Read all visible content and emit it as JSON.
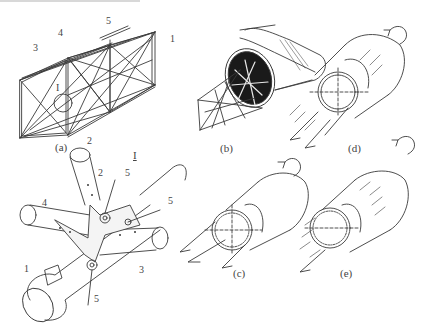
{
  "figure": {
    "panels": [
      {
        "id": "a",
        "caption": "(a)",
        "description": "Space truss frame (lattice box girder)"
      },
      {
        "id": "b",
        "caption": "(b)",
        "description": "Truss transitioning into closed cylindrical shell"
      },
      {
        "id": "c",
        "caption": "(c)",
        "description": "Cylinder under torsion with shear flow arrows"
      },
      {
        "id": "d",
        "caption": "(d)",
        "description": "Cylinder cross-section with axial load and torque"
      },
      {
        "id": "e",
        "caption": "(e)",
        "description": "Cylinder with distributed axial stresses and torque"
      }
    ],
    "detail": {
      "label": "I",
      "description": "Enlarged joint node detail"
    },
    "callouts_a": [
      "1",
      "2",
      "3",
      "4",
      "5"
    ],
    "callouts_detail": [
      "1",
      "2",
      "3",
      "4",
      "5",
      "5",
      "5"
    ],
    "detail_marker_on_a": "I"
  },
  "colors": {
    "ink": "#3a3a3a",
    "fill_dark": "#1a1a1a",
    "paper": "#ffffff"
  }
}
